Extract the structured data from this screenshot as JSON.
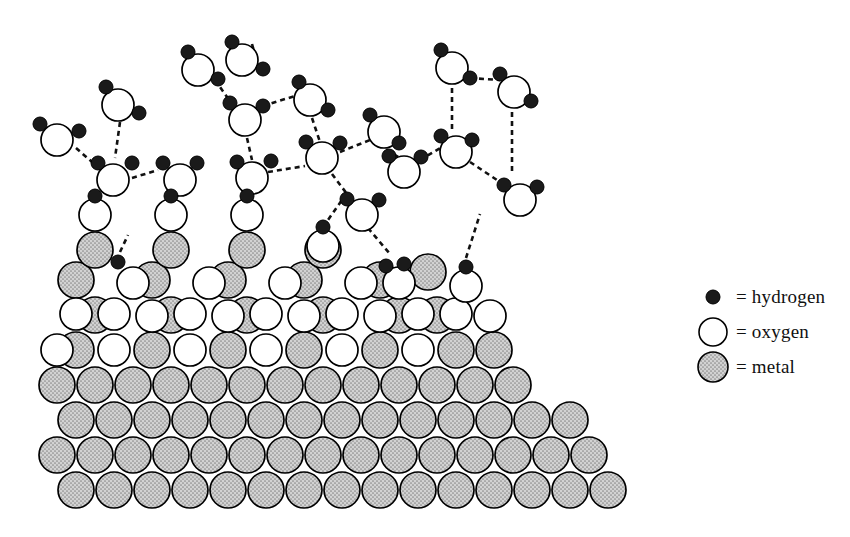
{
  "figure": {
    "background_color": "#ffffff"
  },
  "legend": {
    "position": "right",
    "items": [
      {
        "id": "hydrogen",
        "label": "= hydrogen",
        "symbol": "filled-small-circle",
        "fill": "#1a1a1a",
        "stroke": "#000000",
        "radius": 7
      },
      {
        "id": "oxygen",
        "label": "= oxygen",
        "symbol": "open-circle",
        "fill": "#ffffff",
        "stroke": "#000000",
        "radius": 15
      },
      {
        "id": "metal",
        "label": "= metal",
        "symbol": "stippled-circle",
        "fill": "#c9c9c9",
        "stroke": "#000000",
        "radius": 17
      }
    ]
  },
  "styles": {
    "hydrogen_fill": "#1a1a1a",
    "oxygen_fill": "#ffffff",
    "metal_fill": "#c8c8c8",
    "outline": "#000000",
    "bond_dash": "#111111"
  },
  "scene": {
    "metal_radius": 18,
    "oxygen_radius": 16,
    "hydrogen_radius": 7,
    "metal_atoms": [
      {
        "x": 76,
        "y": 490
      },
      {
        "x": 114,
        "y": 490
      },
      {
        "x": 152,
        "y": 490
      },
      {
        "x": 190,
        "y": 490
      },
      {
        "x": 228,
        "y": 490
      },
      {
        "x": 266,
        "y": 490
      },
      {
        "x": 304,
        "y": 490
      },
      {
        "x": 342,
        "y": 490
      },
      {
        "x": 380,
        "y": 490
      },
      {
        "x": 418,
        "y": 490
      },
      {
        "x": 456,
        "y": 490
      },
      {
        "x": 494,
        "y": 490
      },
      {
        "x": 532,
        "y": 490
      },
      {
        "x": 570,
        "y": 490
      },
      {
        "x": 608,
        "y": 490
      },
      {
        "x": 57,
        "y": 455
      },
      {
        "x": 95,
        "y": 455
      },
      {
        "x": 133,
        "y": 455
      },
      {
        "x": 171,
        "y": 455
      },
      {
        "x": 209,
        "y": 455
      },
      {
        "x": 247,
        "y": 455
      },
      {
        "x": 285,
        "y": 455
      },
      {
        "x": 323,
        "y": 455
      },
      {
        "x": 361,
        "y": 455
      },
      {
        "x": 399,
        "y": 455
      },
      {
        "x": 437,
        "y": 455
      },
      {
        "x": 475,
        "y": 455
      },
      {
        "x": 513,
        "y": 455
      },
      {
        "x": 551,
        "y": 455
      },
      {
        "x": 589,
        "y": 455
      },
      {
        "x": 76,
        "y": 420
      },
      {
        "x": 114,
        "y": 420
      },
      {
        "x": 152,
        "y": 420
      },
      {
        "x": 190,
        "y": 420
      },
      {
        "x": 228,
        "y": 420
      },
      {
        "x": 266,
        "y": 420
      },
      {
        "x": 304,
        "y": 420
      },
      {
        "x": 342,
        "y": 420
      },
      {
        "x": 380,
        "y": 420
      },
      {
        "x": 418,
        "y": 420
      },
      {
        "x": 456,
        "y": 420
      },
      {
        "x": 494,
        "y": 420
      },
      {
        "x": 532,
        "y": 420
      },
      {
        "x": 570,
        "y": 420
      },
      {
        "x": 57,
        "y": 385
      },
      {
        "x": 95,
        "y": 385
      },
      {
        "x": 133,
        "y": 385
      },
      {
        "x": 171,
        "y": 385
      },
      {
        "x": 209,
        "y": 385
      },
      {
        "x": 247,
        "y": 385
      },
      {
        "x": 285,
        "y": 385
      },
      {
        "x": 323,
        "y": 385
      },
      {
        "x": 361,
        "y": 385
      },
      {
        "x": 399,
        "y": 385
      },
      {
        "x": 437,
        "y": 385
      },
      {
        "x": 475,
        "y": 385
      },
      {
        "x": 513,
        "y": 385
      },
      {
        "x": 76,
        "y": 350
      },
      {
        "x": 152,
        "y": 350
      },
      {
        "x": 228,
        "y": 350
      },
      {
        "x": 304,
        "y": 350
      },
      {
        "x": 380,
        "y": 350
      },
      {
        "x": 456,
        "y": 350
      },
      {
        "x": 494,
        "y": 350
      },
      {
        "x": 95,
        "y": 315
      },
      {
        "x": 171,
        "y": 315
      },
      {
        "x": 247,
        "y": 315
      },
      {
        "x": 323,
        "y": 315
      },
      {
        "x": 399,
        "y": 315
      },
      {
        "x": 437,
        "y": 315
      },
      {
        "x": 76,
        "y": 280
      },
      {
        "x": 152,
        "y": 280
      },
      {
        "x": 228,
        "y": 280
      },
      {
        "x": 304,
        "y": 280
      },
      {
        "x": 380,
        "y": 280
      },
      {
        "x": 95,
        "y": 250
      },
      {
        "x": 171,
        "y": 250
      },
      {
        "x": 247,
        "y": 250
      },
      {
        "x": 323,
        "y": 250
      },
      {
        "x": 428,
        "y": 272
      }
    ],
    "oxygen_atoms": [
      {
        "x": 95,
        "y": 215
      },
      {
        "x": 171,
        "y": 215
      },
      {
        "x": 247,
        "y": 215
      },
      {
        "x": 323,
        "y": 246
      },
      {
        "x": 76,
        "y": 314
      },
      {
        "x": 114,
        "y": 314
      },
      {
        "x": 190,
        "y": 314
      },
      {
        "x": 266,
        "y": 314
      },
      {
        "x": 342,
        "y": 314
      },
      {
        "x": 418,
        "y": 314
      },
      {
        "x": 456,
        "y": 314
      },
      {
        "x": 133,
        "y": 283
      },
      {
        "x": 209,
        "y": 283
      },
      {
        "x": 285,
        "y": 283
      },
      {
        "x": 361,
        "y": 283
      },
      {
        "x": 399,
        "y": 283
      },
      {
        "x": 57,
        "y": 350
      },
      {
        "x": 114,
        "y": 350
      },
      {
        "x": 190,
        "y": 350
      },
      {
        "x": 266,
        "y": 350
      },
      {
        "x": 342,
        "y": 350
      },
      {
        "x": 418,
        "y": 350
      },
      {
        "x": 152,
        "y": 316
      },
      {
        "x": 228,
        "y": 316
      },
      {
        "x": 304,
        "y": 316
      },
      {
        "x": 380,
        "y": 316
      },
      {
        "x": 466,
        "y": 286
      },
      {
        "x": 490,
        "y": 316
      }
    ],
    "surface_hydroxyl_hydrogens": [
      {
        "x": 95,
        "y": 196
      },
      {
        "x": 171,
        "y": 196
      },
      {
        "x": 247,
        "y": 196
      },
      {
        "x": 323,
        "y": 227
      },
      {
        "x": 386,
        "y": 266
      },
      {
        "x": 404,
        "y": 264
      },
      {
        "x": 466,
        "y": 267
      },
      {
        "x": 118,
        "y": 262
      }
    ],
    "water_molecules": [
      {
        "id": "w1",
        "ox": 57,
        "oy": 140,
        "h": [
          {
            "x": 40,
            "y": 124
          },
          {
            "x": 79,
            "y": 131
          }
        ]
      },
      {
        "id": "w2",
        "ox": 118,
        "oy": 105,
        "h": [
          {
            "x": 106,
            "y": 87
          },
          {
            "x": 139,
            "y": 113
          }
        ]
      },
      {
        "id": "w3",
        "ox": 113,
        "oy": 180,
        "h": [
          {
            "x": 98,
            "y": 163
          },
          {
            "x": 132,
            "y": 163
          }
        ]
      },
      {
        "id": "w4",
        "ox": 180,
        "oy": 180,
        "h": [
          {
            "x": 163,
            "y": 163
          },
          {
            "x": 197,
            "y": 163
          }
        ]
      },
      {
        "id": "w5",
        "ox": 242,
        "oy": 60,
        "h": [
          {
            "x": 232,
            "y": 42
          },
          {
            "x": 263,
            "y": 69
          }
        ]
      },
      {
        "id": "w6",
        "ox": 245,
        "oy": 120,
        "h": [
          {
            "x": 230,
            "y": 103
          },
          {
            "x": 263,
            "y": 106
          }
        ]
      },
      {
        "id": "w7",
        "ox": 252,
        "oy": 178,
        "h": [
          {
            "x": 237,
            "y": 162
          },
          {
            "x": 271,
            "y": 161
          }
        ]
      },
      {
        "id": "w8",
        "ox": 310,
        "oy": 100,
        "h": [
          {
            "x": 299,
            "y": 82
          },
          {
            "x": 328,
            "y": 110
          }
        ]
      },
      {
        "id": "w9",
        "ox": 322,
        "oy": 158,
        "h": [
          {
            "x": 306,
            "y": 142
          },
          {
            "x": 340,
            "y": 143
          }
        ]
      },
      {
        "id": "w10",
        "ox": 362,
        "oy": 215,
        "h": [
          {
            "x": 347,
            "y": 199
          },
          {
            "x": 379,
            "y": 200
          }
        ]
      },
      {
        "id": "w11",
        "ox": 384,
        "oy": 132,
        "h": [
          {
            "x": 370,
            "y": 115
          },
          {
            "x": 399,
            "y": 143
          }
        ]
      },
      {
        "id": "w12",
        "ox": 452,
        "oy": 68,
        "h": [
          {
            "x": 441,
            "y": 50
          },
          {
            "x": 470,
            "y": 78
          }
        ]
      },
      {
        "id": "w13",
        "ox": 456,
        "oy": 152,
        "h": [
          {
            "x": 441,
            "y": 136
          },
          {
            "x": 472,
            "y": 140
          }
        ]
      },
      {
        "id": "w14",
        "ox": 404,
        "oy": 172,
        "h": [
          {
            "x": 389,
            "y": 156
          },
          {
            "x": 421,
            "y": 157
          }
        ]
      },
      {
        "id": "w15",
        "ox": 514,
        "oy": 92,
        "h": [
          {
            "x": 500,
            "y": 74
          },
          {
            "x": 531,
            "y": 101
          }
        ]
      },
      {
        "id": "w16",
        "ox": 520,
        "oy": 200,
        "h": [
          {
            "x": 504,
            "y": 185
          },
          {
            "x": 537,
            "y": 187
          }
        ]
      },
      {
        "id": "w17",
        "ox": 198,
        "oy": 70,
        "h": [
          {
            "x": 188,
            "y": 52
          },
          {
            "x": 218,
            "y": 79
          }
        ]
      }
    ],
    "hydrogen_bonds": [
      {
        "x1": 76,
        "y1": 148,
        "x2": 100,
        "y2": 169
      },
      {
        "x1": 120,
        "y1": 122,
        "x2": 115,
        "y2": 158
      },
      {
        "x1": 132,
        "y1": 178,
        "x2": 158,
        "y2": 170
      },
      {
        "x1": 215,
        "y1": 80,
        "x2": 232,
        "y2": 104
      },
      {
        "x1": 247,
        "y1": 138,
        "x2": 252,
        "y2": 160
      },
      {
        "x1": 263,
        "y1": 106,
        "x2": 298,
        "y2": 95
      },
      {
        "x1": 268,
        "y1": 172,
        "x2": 305,
        "y2": 166
      },
      {
        "x1": 252,
        "y1": 44,
        "x2": 256,
        "y2": 58
      },
      {
        "x1": 312,
        "y1": 118,
        "x2": 320,
        "y2": 142
      },
      {
        "x1": 340,
        "y1": 152,
        "x2": 370,
        "y2": 140
      },
      {
        "x1": 332,
        "y1": 174,
        "x2": 350,
        "y2": 198
      },
      {
        "x1": 386,
        "y1": 150,
        "x2": 400,
        "y2": 158
      },
      {
        "x1": 420,
        "y1": 160,
        "x2": 442,
        "y2": 147
      },
      {
        "x1": 452,
        "y1": 88,
        "x2": 452,
        "y2": 132
      },
      {
        "x1": 470,
        "y1": 78,
        "x2": 500,
        "y2": 80
      },
      {
        "x1": 470,
        "y1": 162,
        "x2": 506,
        "y2": 186
      },
      {
        "x1": 368,
        "y1": 228,
        "x2": 390,
        "y2": 254
      },
      {
        "x1": 512,
        "y1": 112,
        "x2": 512,
        "y2": 172
      },
      {
        "x1": 96,
        "y1": 196,
        "x2": 105,
        "y2": 173
      },
      {
        "x1": 172,
        "y1": 196,
        "x2": 180,
        "y2": 172
      },
      {
        "x1": 248,
        "y1": 196,
        "x2": 252,
        "y2": 178
      },
      {
        "x1": 323,
        "y1": 227,
        "x2": 342,
        "y2": 200
      },
      {
        "x1": 466,
        "y1": 258,
        "x2": 480,
        "y2": 214
      },
      {
        "x1": 120,
        "y1": 252,
        "x2": 128,
        "y2": 235
      }
    ]
  }
}
